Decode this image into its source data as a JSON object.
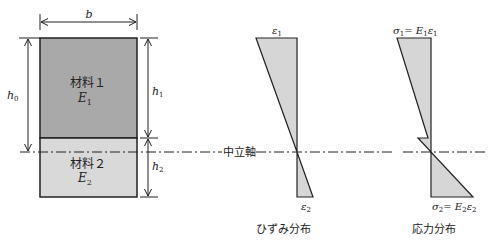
{
  "colors": {
    "material1_fill": "#a9a9a9",
    "material2_fill": "#d9d9d9",
    "distribution_fill": "#d6d6d6",
    "stroke": "#222222"
  },
  "section": {
    "width_label": "b",
    "total_height_label": "h",
    "total_height_sub": "0",
    "h1_label": "h",
    "h1_sub": "1",
    "h2_label": "h",
    "h2_sub": "2",
    "material1": {
      "name": "材料１",
      "modulus": "E",
      "modulus_sub": "1"
    },
    "material2": {
      "name": "材料２",
      "modulus": "E",
      "modulus_sub": "2"
    }
  },
  "neutral_axis": {
    "label": "中立軸"
  },
  "strain": {
    "title": "ひずみ分布",
    "top_label": "ε",
    "top_sub": "1",
    "bottom_label": "ε",
    "bottom_sub": "2"
  },
  "stress": {
    "title": "応力分布",
    "top_label_sigma": "σ",
    "top_label_sigma_sub": "1",
    "top_label_eq": "= E",
    "top_label_E_sub": "1",
    "top_label_eps": "ε",
    "top_label_eps_sub": "1",
    "bottom_label_sigma": "σ",
    "bottom_label_sigma_sub": "2",
    "bottom_label_eq": "= E",
    "bottom_label_E_sub": "2",
    "bottom_label_eps": "ε",
    "bottom_label_eps_sub": "2"
  }
}
